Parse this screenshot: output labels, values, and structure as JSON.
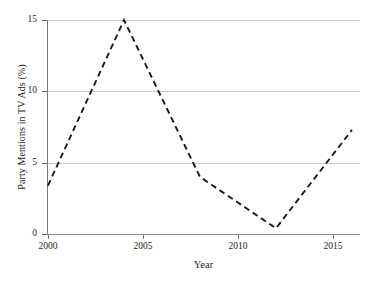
{
  "chart_data": {
    "type": "line",
    "title": "",
    "xlabel": "Year",
    "ylabel": "Party Mentions in TV Ads (%)",
    "x": [
      2000,
      2004,
      2008,
      2012,
      2016
    ],
    "values": [
      3.4,
      15.0,
      4.0,
      0.4,
      7.3
    ],
    "series": [
      {
        "name": "Party Mentions in TV Ads (%)",
        "x": [
          2000,
          2004,
          2008,
          2012,
          2016
        ],
        "values": [
          3.4,
          15.0,
          4.0,
          0.4,
          7.3
        ]
      }
    ],
    "xlim": [
      2000,
      2016.8
    ],
    "ylim": [
      0,
      15
    ],
    "xticks": [
      2000,
      2005,
      2010,
      2015
    ],
    "xtick_labels": [
      "2000",
      "2005",
      "2010",
      "2015"
    ],
    "yticks": [
      0,
      5,
      10,
      15
    ],
    "ytick_labels": [
      "0",
      "5",
      "10",
      "15"
    ],
    "grid": "horizontal",
    "legend": "none",
    "line_style": "dashed",
    "line_color": "#1a1a1a",
    "grid_color": "#c9c9c9",
    "axis_color": "#7a7a7a",
    "background": "#ffffff"
  },
  "axes": {
    "y_ticks": [
      {
        "label": "15",
        "value": 15
      },
      {
        "label": "10",
        "value": 10
      },
      {
        "label": "5",
        "value": 5
      },
      {
        "label": "0",
        "value": 0
      }
    ],
    "x_ticks": [
      {
        "label": "2000",
        "value": 2000
      },
      {
        "label": "2005",
        "value": 2005
      },
      {
        "label": "2010",
        "value": 2010
      },
      {
        "label": "2015",
        "value": 2015
      }
    ]
  }
}
